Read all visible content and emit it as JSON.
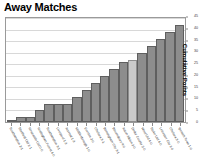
{
  "chart_data": {
    "type": "bar",
    "title": "Away Matches",
    "xlabel": "",
    "ylabel": "Cumulative Points",
    "ylim": [
      0,
      45
    ],
    "yticks": [
      0,
      5,
      10,
      15,
      20,
      25,
      30,
      35,
      40,
      45
    ],
    "grid": true,
    "legend": "none",
    "categories": [
      "Southampton 2-1",
      "Sheffield Utd 1-1",
      "Newcastle Utd 0-0",
      "Nottingham Forest 4-0",
      "Southampton 3-1",
      "Liverpool 1-3",
      "Arsenal 1-3",
      "Middlesbrough 1-0",
      "Everton 2-0",
      "Chelsea 3-1",
      "Birmingham City 3-1",
      "Bloomsbury 4-0",
      "Aston Albion 2-0",
      "Derby County 2-0",
      "West Utd 4-0",
      "Stoke Utd 4-0",
      "Leicester City 1-0",
      "Chelsea 3-0",
      "Ipswich Town 1-0"
    ],
    "values": [
      1,
      2,
      2,
      5,
      8,
      8,
      8,
      11,
      14,
      17,
      20,
      23,
      26,
      27,
      30,
      33,
      36,
      39,
      42
    ],
    "highlight_index": 13,
    "colors": {
      "bar": "#8d8d8d",
      "bar_border": "#5f5f5f",
      "bar_highlight": "#cacaca",
      "bar_highlight_border": "#8e8e8e",
      "grid": "#d8d8d8",
      "frame": "#9a9a9a",
      "text": "#111111"
    }
  }
}
